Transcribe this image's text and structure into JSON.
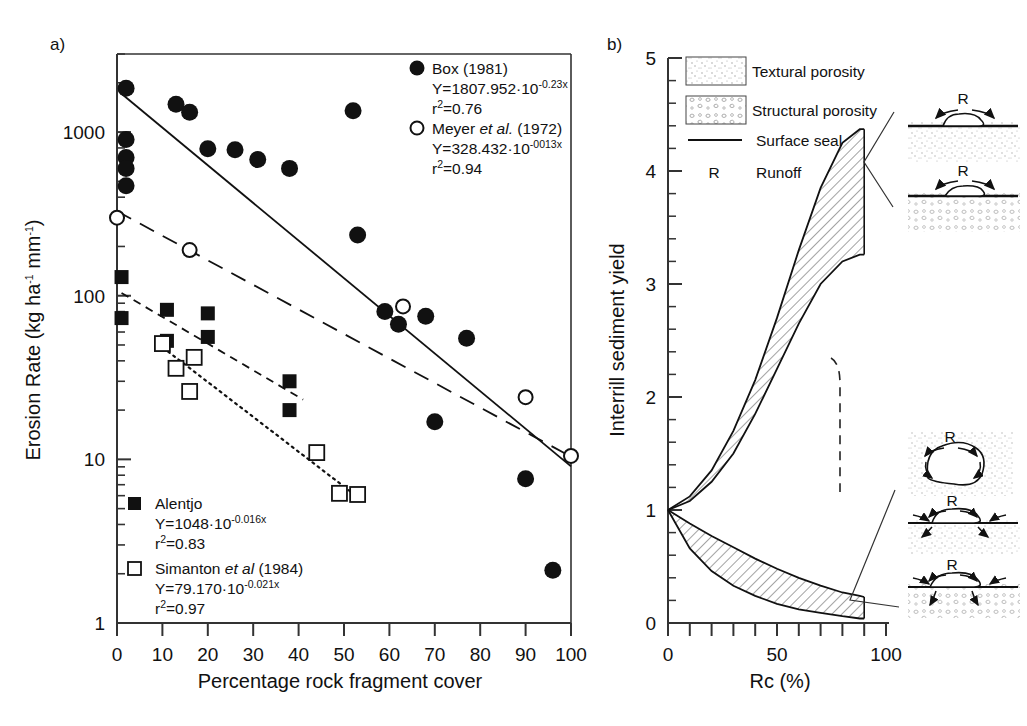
{
  "figure": {
    "panel_a_label": "a)",
    "panel_b_label": "b)"
  },
  "panel_a": {
    "ylabel_main": "Erosion Rate (kg ha",
    "ylabel_sup1": "-1",
    "ylabel_mid": " mm",
    "ylabel_sup2": "-1",
    "ylabel_end": ")",
    "xlabel": "Percentage rock fragment cover",
    "y_ticks": [
      "1000",
      "100",
      "10",
      "1"
    ],
    "x_ticks": [
      "0",
      "10",
      "20",
      "30",
      "40",
      "50",
      "60",
      "70",
      "80",
      "90",
      "100"
    ],
    "legend_top": [
      {
        "marker": "filled-circle",
        "label": "Box (1981)",
        "equation_base": "Y=1807.952·10",
        "equation_exp": "-0.23x",
        "r2_sym": "r",
        "r2_sup": "2",
        "r2_val": "=0.76"
      },
      {
        "marker": "open-circle",
        "label_plain": "Meyer ",
        "label_italic": "et al.",
        "label_plain2": " (1972)",
        "equation_base": "Y=328.432·10",
        "equation_exp": "-0013x",
        "r2_sym": "r",
        "r2_sup": "2",
        "r2_val": "=0.94"
      }
    ],
    "legend_bottom": [
      {
        "marker": "filled-square",
        "label": "Alentjo",
        "equation_base": "Y=1048·10",
        "equation_exp": "-0.016x",
        "r2_sym": "r",
        "r2_sup": "2",
        "r2_val": "=0.83"
      },
      {
        "marker": "open-square",
        "label_plain": "Simanton ",
        "label_italic": "et al",
        "label_plain2": " (1984)",
        "equation_base": "Y=79.170·10",
        "equation_exp": "-0.021x",
        "r2_sym": "r",
        "r2_sup": "2",
        "r2_val": "=0.97"
      }
    ]
  },
  "panel_b": {
    "ylabel": "Interrill sediment yield",
    "xlabel": "Rc (%)",
    "y_ticks": [
      "0",
      "1",
      "2",
      "3",
      "4",
      "5"
    ],
    "x_ticks": [
      "0",
      "50",
      "100"
    ],
    "legend": [
      {
        "swatch": "textural-porosity-swatch",
        "label": "Textural porosity"
      },
      {
        "swatch": "structural-porosity-swatch",
        "label": "Structural porosity"
      },
      {
        "swatch": "surface-seal-line",
        "label": "Surface seal"
      },
      {
        "swatch": "runoff-symbol",
        "symbol": "R",
        "label": "Runoff"
      }
    ],
    "runoff_symbol": "R"
  },
  "chart_data": [
    {
      "type": "scatter",
      "title": "a)",
      "xlabel": "Percentage rock fragment cover",
      "ylabel": "Erosion Rate (kg ha-1 mm-1)",
      "xlim": [
        0,
        100
      ],
      "ylim": [
        1,
        3000
      ],
      "yscale": "log",
      "grid": false,
      "legend_position": "inside-top-right / inside-bottom-left",
      "series": [
        {
          "name": "Box (1981)",
          "marker": "filled-circle",
          "fit_equation": "Y=1807.952*10^(-0.23x)",
          "r2": 0.76,
          "fit_line_style": "solid",
          "points": [
            {
              "x": 2,
              "y": 1850
            },
            {
              "x": 2,
              "y": 900
            },
            {
              "x": 2,
              "y": 700
            },
            {
              "x": 2,
              "y": 600
            },
            {
              "x": 2,
              "y": 470
            },
            {
              "x": 13,
              "y": 1480
            },
            {
              "x": 16,
              "y": 1320
            },
            {
              "x": 20,
              "y": 790
            },
            {
              "x": 26,
              "y": 780
            },
            {
              "x": 31,
              "y": 680
            },
            {
              "x": 38,
              "y": 600
            },
            {
              "x": 52,
              "y": 1350
            },
            {
              "x": 53,
              "y": 235
            },
            {
              "x": 59,
              "y": 80
            },
            {
              "x": 62,
              "y": 67
            },
            {
              "x": 68,
              "y": 75
            },
            {
              "x": 70,
              "y": 17
            },
            {
              "x": 77,
              "y": 55
            },
            {
              "x": 90,
              "y": 7.6
            },
            {
              "x": 96,
              "y": 2.1
            }
          ]
        },
        {
          "name": "Meyer et al. (1972)",
          "marker": "open-circle",
          "fit_equation": "Y=328.432*10^(-0013x)",
          "r2": 0.94,
          "fit_line_style": "dashed",
          "points": [
            {
              "x": 0,
              "y": 300
            },
            {
              "x": 16,
              "y": 190
            },
            {
              "x": 63,
              "y": 86
            },
            {
              "x": 90,
              "y": 24
            },
            {
              "x": 100,
              "y": 10.5
            }
          ]
        },
        {
          "name": "Alentjo",
          "marker": "filled-square",
          "fit_equation": "Y=1048*10^(-0.016x)",
          "r2": 0.83,
          "fit_line_style": "short-dash",
          "points": [
            {
              "x": 1,
              "y": 130
            },
            {
              "x": 1,
              "y": 73
            },
            {
              "x": 11,
              "y": 82
            },
            {
              "x": 11,
              "y": 53
            },
            {
              "x": 20,
              "y": 78
            },
            {
              "x": 20,
              "y": 56
            },
            {
              "x": 38,
              "y": 30
            },
            {
              "x": 38,
              "y": 20
            }
          ]
        },
        {
          "name": "Simanton et al (1984)",
          "marker": "open-square",
          "fit_equation": "Y=79.170*10^(-0.021x)",
          "r2": 0.97,
          "fit_line_style": "dotted",
          "points": [
            {
              "x": 10,
              "y": 51
            },
            {
              "x": 13,
              "y": 36
            },
            {
              "x": 17,
              "y": 42
            },
            {
              "x": 16,
              "y": 26
            },
            {
              "x": 44,
              "y": 11
            },
            {
              "x": 49,
              "y": 6.2
            },
            {
              "x": 53,
              "y": 6.1
            }
          ]
        }
      ]
    },
    {
      "type": "area",
      "title": "b)",
      "xlabel": "Rc (%)",
      "ylabel": "Interrill sediment yield",
      "xlim": [
        0,
        100
      ],
      "ylim": [
        0,
        5
      ],
      "grid": false,
      "legend_position": "inside-top-left",
      "annotations": [
        "Textural porosity",
        "Structural porosity",
        "Surface seal",
        "R  Runoff"
      ],
      "series": [
        {
          "name": "Upper band (structural porosity) - top bound",
          "x": [
            0,
            10,
            20,
            30,
            40,
            50,
            60,
            70,
            80,
            88,
            90
          ],
          "values": [
            1.0,
            1.12,
            1.35,
            1.7,
            2.15,
            2.7,
            3.3,
            3.85,
            4.25,
            4.37,
            4.37
          ]
        },
        {
          "name": "Upper band - lower bound",
          "x": [
            0,
            10,
            20,
            30,
            40,
            50,
            60,
            70,
            80,
            88,
            90
          ],
          "values": [
            1.0,
            1.08,
            1.25,
            1.5,
            1.85,
            2.25,
            2.65,
            3.0,
            3.2,
            3.26,
            3.26
          ]
        },
        {
          "name": "Lower band - upper bound",
          "x": [
            0,
            10,
            20,
            30,
            40,
            50,
            60,
            70,
            80,
            88,
            90
          ],
          "values": [
            1.0,
            0.88,
            0.77,
            0.67,
            0.57,
            0.48,
            0.4,
            0.33,
            0.27,
            0.24,
            0.23
          ]
        },
        {
          "name": "Lower band - lower bound",
          "x": [
            0,
            10,
            20,
            30,
            40,
            50,
            60,
            70,
            80,
            88,
            90
          ],
          "values": [
            1.0,
            0.66,
            0.46,
            0.33,
            0.24,
            0.17,
            0.12,
            0.09,
            0.06,
            0.04,
            0.04
          ]
        }
      ]
    }
  ]
}
